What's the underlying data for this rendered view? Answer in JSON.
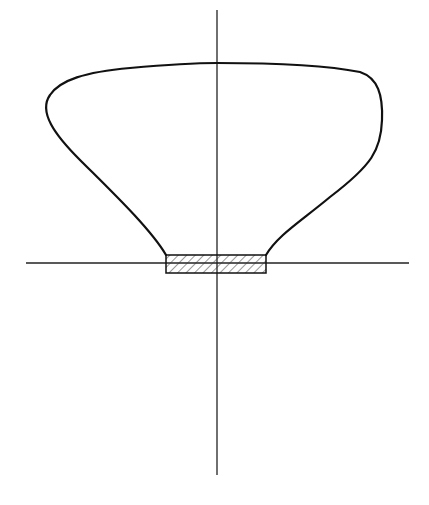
{
  "diagram": {
    "type": "vessel-profile-cross-section",
    "canvas": {
      "width": 429,
      "height": 505,
      "background": "#ffffff"
    },
    "colors": {
      "stroke": "#111111",
      "axis": "#222222",
      "hatch": "#333333"
    },
    "axes": {
      "vertical": {
        "x": 217,
        "y1": 10,
        "y2": 475
      },
      "horizontal": {
        "y": 263,
        "x1": 26,
        "x2": 409
      }
    },
    "profile": {
      "description": "bowl / vessel outline with wide rounded rim and narrowing neck",
      "path": "M 166 255 C 150 228, 110 190, 80 160 C 55 135, 38 112, 50 95 C 60 80, 85 72, 130 68 C 175 64, 200 63, 217 63 C 260 63, 320 64, 360 72 C 378 78, 383 95, 382 120 C 381 150, 372 165, 330 197 C 300 222, 278 235, 266 255"
    },
    "base": {
      "x": 166,
      "y": 255,
      "width": 100,
      "height": 18,
      "fill": "hatched"
    }
  }
}
